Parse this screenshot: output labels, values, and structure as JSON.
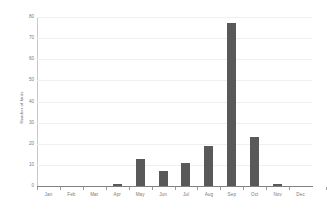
{
  "chart_data": {
    "type": "bar",
    "title": "",
    "xlabel": "",
    "ylabel": "Number of birds",
    "categories": [
      "Jan",
      "Feb",
      "Mar",
      "Apr",
      "May",
      "Jun",
      "Jul",
      "Aug",
      "Sep",
      "Oct",
      "Nov",
      "Dec"
    ],
    "values": [
      0,
      0,
      0,
      1,
      13,
      7,
      11,
      19,
      77,
      23,
      1,
      0
    ],
    "ylim": [
      0,
      80
    ],
    "y_ticks": [
      0,
      10,
      20,
      30,
      40,
      50,
      60,
      70,
      80
    ],
    "y_tick_labels": [
      "0",
      "10",
      "20",
      "30",
      "40",
      "50",
      "60",
      "70",
      "80"
    ],
    "grid": true,
    "legend": "none",
    "series_color": "#595959"
  },
  "axes": {
    "y_title": "Number of birds"
  },
  "colors": {
    "bar": "#595959",
    "grid": "#efefef",
    "axis": "#808080",
    "tick_text": "#7a7a7a"
  }
}
